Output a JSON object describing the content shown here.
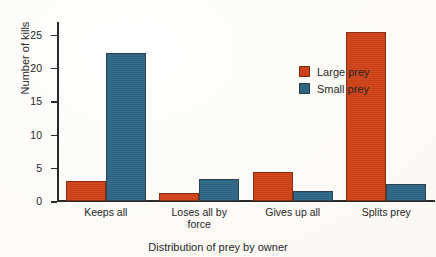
{
  "chart_data": {
    "type": "bar",
    "title": "",
    "xlabel": "Distribution of prey by owner",
    "ylabel": "Number of kills",
    "categories": [
      "Keeps all",
      "Loses all by force",
      "Gives up all",
      "Splits prey"
    ],
    "category_lines": [
      [
        "Keeps all"
      ],
      [
        "Loses all by",
        "force"
      ],
      [
        "Gives up all"
      ],
      [
        "Splits prey"
      ]
    ],
    "series": [
      {
        "name": "Large prey",
        "color": "#cf4217",
        "values": [
          3.0,
          1.2,
          4.3,
          25.3
        ]
      },
      {
        "name": "Small prey",
        "color": "#2e6785",
        "values": [
          22.1,
          3.2,
          1.4,
          2.5
        ]
      }
    ],
    "ylim": [
      0,
      27
    ],
    "yticks": [
      0,
      5,
      10,
      15,
      20,
      25
    ],
    "ytick_labels": [
      "0",
      "5",
      "10",
      "15",
      "20",
      "25"
    ],
    "grid": false,
    "legend_position": "upper center"
  },
  "legend": {
    "entries": [
      {
        "label": "Large prey",
        "key": "large"
      },
      {
        "label": "Small prey",
        "key": "small"
      }
    ]
  },
  "colors": {
    "large_prey": "#cf4217",
    "small_prey": "#2e6785",
    "axis": "#2a2a2a",
    "background": "#fbfaf7",
    "text": "#262626"
  }
}
